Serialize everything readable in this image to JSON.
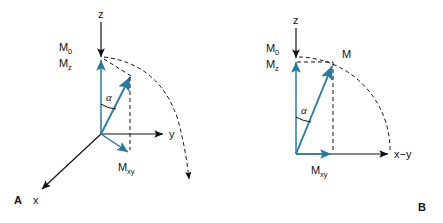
{
  "figure": {
    "type": "vector-diagram",
    "background_color": "#ffffff",
    "stroke_color": "#121212",
    "vector_color": "#2c7a9e"
  },
  "panels": [
    {
      "letter": "A",
      "description": "3D coordinate system showing magnetization vector tipped by angle alpha",
      "axes": [
        {
          "name": "z",
          "label": "z"
        },
        {
          "name": "y",
          "label": "y"
        },
        {
          "name": "x",
          "label": "x"
        }
      ],
      "labels": {
        "m0": "M",
        "m0_sub": "0",
        "mz": "M",
        "mz_sub": "z",
        "mxy": "M",
        "mxy_sub": "xy",
        "angle": "α"
      }
    },
    {
      "letter": "B",
      "description": "2D projection showing magnetization vector M with components Mz and Mxy",
      "axes": [
        {
          "name": "z",
          "label": "z"
        },
        {
          "name": "x-y",
          "label": "x−y"
        }
      ],
      "labels": {
        "m0": "M",
        "m0_sub": "0",
        "mz": "M",
        "mz_sub": "z",
        "m": "M",
        "mxy": "M",
        "mxy_sub": "xy",
        "angle": "α"
      }
    }
  ]
}
